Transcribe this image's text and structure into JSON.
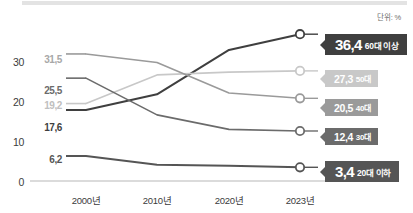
{
  "unit_note": "단위: %",
  "chart_data": {
    "type": "line",
    "title": "",
    "subtitle": "",
    "xlabel": "",
    "ylabel": "",
    "unit": "단위: %",
    "x": [
      "2000년",
      "2010년",
      "2020년",
      "2023년"
    ],
    "categories": [
      "2000년",
      "2010년",
      "2020년",
      "2023년"
    ],
    "ylim": [
      0,
      33
    ],
    "yticks": [
      0,
      10,
      20,
      30
    ],
    "ytick_labels": [
      "0",
      "10",
      "20",
      "30"
    ],
    "grid": false,
    "legend": "right-end-labels",
    "series": [
      {
        "name": "60대 이상",
        "color": "#3f3f3f",
        "values": [
          17.6,
          21.5,
          32.5,
          36.4
        ],
        "start_label": "17.6",
        "end_label": "36.4",
        "emphasis": true
      },
      {
        "name": "50대",
        "color": "#c8c8c8",
        "values": [
          19.2,
          26.3,
          27.0,
          27.3
        ],
        "start_label": "19.2",
        "end_label": "27.3",
        "emphasis": false
      },
      {
        "name": "40대",
        "color": "#9a9a9a",
        "values": [
          31.5,
          29.4,
          21.8,
          20.5
        ],
        "start_label": "31.5",
        "end_label": "20.5",
        "emphasis": false
      },
      {
        "name": "30대",
        "color": "#6b6b6b",
        "values": [
          25.5,
          16.4,
          12.8,
          12.4
        ],
        "start_label": "25.5",
        "end_label": "12.4",
        "emphasis": false
      },
      {
        "name": "20대 이하",
        "color": "#555555",
        "values": [
          6.2,
          4.0,
          3.8,
          3.4
        ],
        "start_label": "6.2",
        "end_label": "3.4",
        "emphasis": true
      }
    ]
  },
  "end_labels": [
    {
      "value": "36,4",
      "category": "60대 이상",
      "bg": "#3f3f3f",
      "text": "#ffffff"
    },
    {
      "value": "27,3",
      "category": "50대",
      "bg": "#c8c8c8",
      "text": "#ffffff"
    },
    {
      "value": "20,5",
      "category": "40대",
      "bg": "#9a9a9a",
      "text": "#ffffff"
    },
    {
      "value": "12,4",
      "category": "30대",
      "bg": "#6b6b6b",
      "text": "#ffffff"
    },
    {
      "value": "3,4",
      "category": "20대 이하",
      "bg": "#555555",
      "text": "#ffffff"
    }
  ],
  "start_labels": [
    {
      "text": "31,5",
      "color": "#a8a8a8"
    },
    {
      "text": "25,5",
      "color": "#6b6b6b"
    },
    {
      "text": "19,2",
      "color": "#c0c0c0"
    },
    {
      "text": "17,6",
      "color": "#3f3f3f"
    },
    {
      "text": "6,2",
      "color": "#555555"
    }
  ],
  "axis": {
    "yticks": [
      "30",
      "20",
      "10",
      "0"
    ],
    "xticks": [
      "2000년",
      "2010년",
      "2020년",
      "2023년"
    ]
  }
}
